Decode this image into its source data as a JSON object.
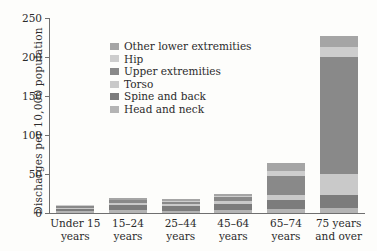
{
  "chart_data": {
    "type": "bar",
    "subtype": "stacked-bar-vertical",
    "title": "",
    "xlabel": "",
    "ylabel": "Discharges per 10,000 population",
    "ylim": [
      0,
      250
    ],
    "yticks": [
      0,
      50,
      100,
      150,
      200,
      250
    ],
    "ytick_labels": [
      "0",
      "50",
      "100",
      "150",
      "200",
      "250"
    ],
    "grid": false,
    "legend_position": "inside-top-left",
    "categories": [
      "Under 15 years",
      "15–24 years",
      "25–44 years",
      "45–64 years",
      "65–74 years",
      "75 years and over"
    ],
    "category_lines": [
      [
        "Under 15",
        "years"
      ],
      [
        "15–24",
        "years"
      ],
      [
        "25–44",
        "years"
      ],
      [
        "45–64",
        "years"
      ],
      [
        "65–74",
        "years"
      ],
      [
        "75 years",
        "and over"
      ]
    ],
    "stack_order_bottom_to_top": [
      "Head and neck",
      "Spine and back",
      "Torso",
      "Upper extremities",
      "Hip",
      "Other lower extremities"
    ],
    "series": [
      {
        "name": "Head and neck",
        "color": "#b4b4b4",
        "values": [
          3.0,
          4.5,
          3.0,
          3.5,
          5.0,
          6.0
        ]
      },
      {
        "name": "Spine and back",
        "color": "#7c7c7c",
        "values": [
          2.5,
          6.0,
          5.5,
          8.5,
          12.0,
          17.5
        ]
      },
      {
        "name": "Torso",
        "color": "#c9c9c9",
        "values": [
          1.5,
          2.5,
          2.5,
          3.5,
          5.5,
          27.0
        ]
      },
      {
        "name": "Upper extremities",
        "color": "#898989",
        "values": [
          2.5,
          3.5,
          3.5,
          5.5,
          25.5,
          150.0
        ]
      },
      {
        "name": "Hip",
        "color": "#cdcdcd",
        "values": [
          0.5,
          0.5,
          0.5,
          1.0,
          6.0,
          13.0
        ]
      },
      {
        "name": "Other lower extremities",
        "color": "#a5a5a5",
        "values": [
          1.0,
          2.0,
          2.5,
          3.0,
          10.5,
          13.5
        ]
      }
    ],
    "totals": [
      11.0,
      19.0,
      17.5,
      25.0,
      64.5,
      227.0
    ]
  },
  "legend": {
    "entries": [
      {
        "label": "Other lower extremities",
        "color": "#a5a5a5"
      },
      {
        "label": "Hip",
        "color": "#cdcdcd"
      },
      {
        "label": "Upper extremities",
        "color": "#898989"
      },
      {
        "label": "Torso",
        "color": "#c9c9c9"
      },
      {
        "label": "Spine and back",
        "color": "#7c7c7c"
      },
      {
        "label": "Head and neck",
        "color": "#b4b4b4"
      }
    ]
  },
  "style": {
    "background": "#fdfdfb",
    "axis_color": "#6f6f6f",
    "text_color": "#2b2b2b"
  }
}
